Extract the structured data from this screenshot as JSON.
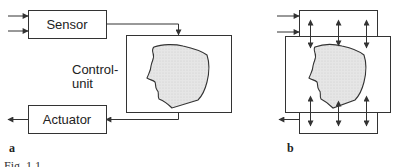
{
  "diagram_a": {
    "panel_label": "a",
    "sensor_label": "Sensor",
    "control_label_line1": "Control-",
    "control_label_line2": "unit",
    "actuator_label": "Actuator"
  },
  "diagram_b": {
    "panel_label": "b"
  },
  "caption": {
    "text": "Fig. 1.1"
  },
  "colors": {
    "line": "#333333",
    "head_fill": "#e4e4e4",
    "head_stroke": "#333333"
  }
}
